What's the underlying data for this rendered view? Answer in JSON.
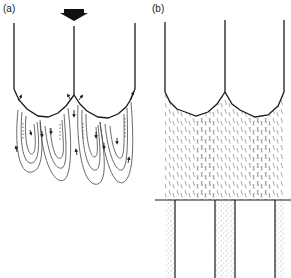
{
  "figure": {
    "panels": [
      {
        "id": "a",
        "label": "(a)",
        "description": "Two adjacent scalloped cells under downward load arrow with circulating flow loops below the cell bottoms"
      },
      {
        "id": "b",
        "label": "(b)",
        "description": "Two adjacent scalloped cells with dashed hatched texture below, horizontal boundary line and stippled vertical bands beneath"
      }
    ],
    "colors": {
      "ink": "#1a1a1a",
      "stroke_light": "#555555",
      "hatch": "#777777",
      "stipple": "#8a8a8a",
      "background": "#ffffff"
    }
  }
}
